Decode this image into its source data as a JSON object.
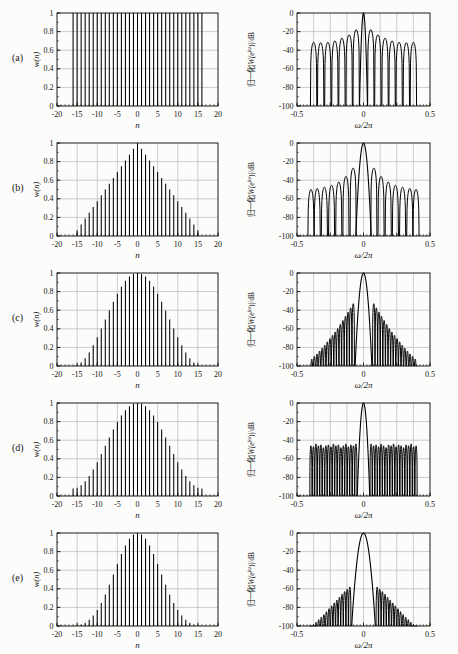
{
  "figure": {
    "title": "",
    "rows": [
      {
        "label": "(a)",
        "window": "rectangular"
      },
      {
        "label": "(b)",
        "window": "triangular (Bartlett)"
      },
      {
        "label": "(c)",
        "window": "Hanning"
      },
      {
        "label": "(d)",
        "window": "Hamming"
      },
      {
        "label": "(e)",
        "window": "Blackman"
      }
    ]
  },
  "colors": {
    "ink": "#141414",
    "grid": "#b8b8b8",
    "frame": "#1a1a1a",
    "background": "#fcfcfb"
  },
  "axes": {
    "time": {
      "xlabel": "n",
      "ylabel": "w(n)",
      "xlim": [
        -20,
        20
      ],
      "ylim": [
        0,
        1
      ],
      "xticks": [
        -20,
        -15,
        -10,
        -5,
        0,
        5,
        10,
        15,
        20
      ],
      "xtick_labels": [
        "-20",
        "-15",
        "-10",
        "-5",
        "0",
        "5",
        "10",
        "15",
        "20"
      ],
      "yticks": [
        0,
        0.2,
        0.4,
        0.6,
        0.8,
        1
      ],
      "ytick_labels": [
        "0",
        "0.2",
        "0.4",
        "0.6",
        "0.8",
        "1"
      ],
      "grid_x": [
        -15,
        -10,
        -5,
        0,
        5,
        10,
        15
      ],
      "grid_y": [
        0.2,
        0.4,
        0.6,
        0.8
      ],
      "minor_x_step": 1,
      "minor_y_step": 0.1,
      "grid_on": true
    },
    "freq": {
      "xlabel": "ω/2π",
      "ylabel": "归一化|W(e^jω)|/dB",
      "ylabel_parts": {
        "prefix": "归一化|",
        "w": "W",
        "open": "(e",
        "sup": "jω",
        "suffix": ")|/dB"
      },
      "xlim": [
        -0.5,
        0.5
      ],
      "ylim": [
        -100,
        0
      ],
      "xticks": [
        -0.5,
        -0.25,
        0,
        0.25,
        0.5
      ],
      "xtick_labels": [
        "-0.5",
        "",
        "0",
        "",
        "0.5"
      ],
      "yticks": [
        0,
        -20,
        -40,
        -60,
        -80,
        -100
      ],
      "ytick_labels": [
        "0",
        "-20",
        "-40",
        "-60",
        "-80",
        "-100"
      ],
      "grid_x": [
        -0.375,
        -0.25,
        -0.125,
        0,
        0.125,
        0.25,
        0.375
      ],
      "grid_y": [
        -20,
        -40,
        -60,
        -80
      ],
      "minor_x_step": 0.025,
      "minor_y_step": 10,
      "grid_on": true
    }
  },
  "chart_data": [
    {
      "row": "a",
      "window": "rectangular",
      "time": {
        "type": "stem",
        "xlabel": "n",
        "ylabel": "w(n)",
        "n_start": -16,
        "values": [
          1,
          1,
          1,
          1,
          1,
          1,
          1,
          1,
          1,
          1,
          1,
          1,
          1,
          1,
          1,
          1,
          1,
          1,
          1,
          1,
          1,
          1,
          1,
          1,
          1,
          1,
          1,
          1,
          1,
          1,
          1,
          1,
          1
        ]
      },
      "freq": {
        "type": "line",
        "xlabel": "ω/2π",
        "ylabel": "归一化|W(ejω)|/dB",
        "peak_db": 0,
        "x_range": [
          -0.4,
          0.4
        ],
        "symmetric": true,
        "main_lobe_halfwidth": 0.03,
        "lobe_halfwidth": 0.024,
        "sidelobes": [
          [
            0.055,
            -18
          ],
          [
            0.108,
            -23.5
          ],
          [
            0.162,
            -27
          ],
          [
            0.215,
            -30
          ],
          [
            0.268,
            -31.5
          ],
          [
            0.322,
            -32
          ],
          [
            0.375,
            -31.5
          ]
        ]
      }
    },
    {
      "row": "b",
      "window": "triangular (Bartlett)",
      "time": {
        "type": "stem",
        "xlabel": "n",
        "ylabel": "w(n)",
        "n_start": -16,
        "values": [
          0,
          0.0625,
          0.125,
          0.1875,
          0.25,
          0.3125,
          0.375,
          0.4375,
          0.5,
          0.5625,
          0.625,
          0.6875,
          0.75,
          0.8125,
          0.875,
          0.9375,
          1,
          0.9375,
          0.875,
          0.8125,
          0.75,
          0.6875,
          0.625,
          0.5625,
          0.5,
          0.4375,
          0.375,
          0.3125,
          0.25,
          0.1875,
          0.125,
          0.0625,
          0
        ]
      },
      "freq": {
        "type": "line",
        "xlabel": "ω/2π",
        "ylabel": "归一化|W(ejω)|/dB",
        "peak_db": 0,
        "x_range": [
          -0.4,
          0.4
        ],
        "symmetric": true,
        "main_lobe_halfwidth": 0.058,
        "lobe_halfwidth": 0.023,
        "sidelobes": [
          [
            0.078,
            -27
          ],
          [
            0.132,
            -36
          ],
          [
            0.186,
            -42
          ],
          [
            0.24,
            -45.5
          ],
          [
            0.294,
            -47.5
          ],
          [
            0.348,
            -49
          ],
          [
            0.395,
            -50
          ]
        ]
      }
    },
    {
      "row": "c",
      "window": "Hanning",
      "time": {
        "type": "stem",
        "xlabel": "n",
        "ylabel": "w(n)",
        "n_start": -16,
        "values": [
          0,
          0.0096,
          0.0381,
          0.0843,
          0.1464,
          0.2222,
          0.3087,
          0.4025,
          0.5,
          0.5975,
          0.6913,
          0.7778,
          0.8536,
          0.9157,
          0.9619,
          0.9904,
          1,
          0.9904,
          0.9619,
          0.9157,
          0.8536,
          0.7778,
          0.6913,
          0.5975,
          0.5,
          0.4025,
          0.3087,
          0.2222,
          0.1464,
          0.0843,
          0.0381,
          0.0096,
          0
        ]
      },
      "freq": {
        "type": "line",
        "xlabel": "ω/2π",
        "ylabel": "归一化|W(ejω)|/dB",
        "peak_db": 0,
        "x_range": [
          -0.4,
          0.4
        ],
        "symmetric": true,
        "main_lobe_halfwidth": 0.063,
        "lobe_halfwidth": 0.0088,
        "sidelobes": [
          [
            0.077,
            -33
          ],
          [
            0.0965,
            -37.5
          ],
          [
            0.116,
            -42
          ],
          [
            0.1355,
            -46.5
          ],
          [
            0.155,
            -51
          ],
          [
            0.1745,
            -55.3
          ],
          [
            0.194,
            -59.7
          ],
          [
            0.2135,
            -63.4
          ],
          [
            0.233,
            -66.9
          ],
          [
            0.2525,
            -70.5
          ],
          [
            0.272,
            -74
          ],
          [
            0.2915,
            -77.5
          ],
          [
            0.311,
            -80.8
          ],
          [
            0.3305,
            -83.9
          ],
          [
            0.35,
            -87
          ],
          [
            0.3695,
            -89.7
          ],
          [
            0.389,
            -92.5
          ]
        ]
      }
    },
    {
      "row": "d",
      "window": "Hamming",
      "time": {
        "type": "stem",
        "xlabel": "n",
        "ylabel": "w(n)",
        "n_start": -16,
        "values": [
          0.08,
          0.0888,
          0.115,
          0.1575,
          0.2147,
          0.2844,
          0.364,
          0.4503,
          0.54,
          0.6297,
          0.716,
          0.7956,
          0.8653,
          0.9225,
          0.965,
          0.9912,
          1,
          0.9912,
          0.965,
          0.9225,
          0.8653,
          0.7956,
          0.716,
          0.6297,
          0.54,
          0.4503,
          0.364,
          0.2844,
          0.2147,
          0.1575,
          0.115,
          0.0888,
          0.08
        ]
      },
      "freq": {
        "type": "line",
        "xlabel": "ω/2π",
        "ylabel": "归一化|W(ejω)|/dB",
        "peak_db": 0,
        "x_range": [
          -0.4,
          0.4
        ],
        "symmetric": true,
        "main_lobe_halfwidth": 0.047,
        "lobe_halfwidth": 0.008,
        "sidelobes": [
          [
            0.057,
            -44
          ],
          [
            0.0758,
            -46
          ],
          [
            0.0946,
            -45
          ],
          [
            0.1134,
            -47
          ],
          [
            0.1322,
            -44
          ],
          [
            0.151,
            -46
          ],
          [
            0.1698,
            -48
          ],
          [
            0.1886,
            -45
          ],
          [
            0.2074,
            -46
          ],
          [
            0.2262,
            -44
          ],
          [
            0.245,
            -47
          ],
          [
            0.2638,
            -45
          ],
          [
            0.2826,
            -46
          ],
          [
            0.3014,
            -48
          ],
          [
            0.3202,
            -45
          ],
          [
            0.339,
            -46
          ],
          [
            0.3578,
            -44
          ],
          [
            0.3766,
            -47
          ],
          [
            0.3954,
            -46
          ]
        ]
      }
    },
    {
      "row": "e",
      "window": "Blackman",
      "time": {
        "type": "stem",
        "xlabel": "n",
        "ylabel": "w(n)",
        "n_start": -16,
        "values": [
          0,
          0.0035,
          0.0146,
          0.0349,
          0.0664,
          0.1116,
          0.1721,
          0.2485,
          0.34,
          0.4436,
          0.5548,
          0.6672,
          0.7736,
          0.8664,
          0.9385,
          0.9843,
          1,
          0.9843,
          0.9385,
          0.8664,
          0.7736,
          0.6672,
          0.5548,
          0.4436,
          0.34,
          0.2485,
          0.1721,
          0.1116,
          0.0664,
          0.0349,
          0.0146,
          0.0035,
          0
        ]
      },
      "freq": {
        "type": "line",
        "xlabel": "ω/2π",
        "ylabel": "归一化|W(ejω)|/dB",
        "peak_db": 0,
        "x_range": [
          -0.4,
          0.4
        ],
        "symmetric": true,
        "main_lobe_halfwidth": 0.089,
        "lobe_halfwidth": 0.0088,
        "sidelobes": [
          [
            0.103,
            -58
          ],
          [
            0.1225,
            -60.5
          ],
          [
            0.142,
            -63
          ],
          [
            0.1615,
            -65.8
          ],
          [
            0.181,
            -69
          ],
          [
            0.2005,
            -72.1
          ],
          [
            0.22,
            -75.2
          ],
          [
            0.2395,
            -78.3
          ],
          [
            0.259,
            -81.4
          ],
          [
            0.2785,
            -84.6
          ],
          [
            0.298,
            -87.7
          ],
          [
            0.3175,
            -90.5
          ],
          [
            0.337,
            -93.2
          ],
          [
            0.3565,
            -95.9
          ],
          [
            0.376,
            -98.4
          ],
          [
            0.3955,
            -100
          ]
        ]
      }
    }
  ]
}
